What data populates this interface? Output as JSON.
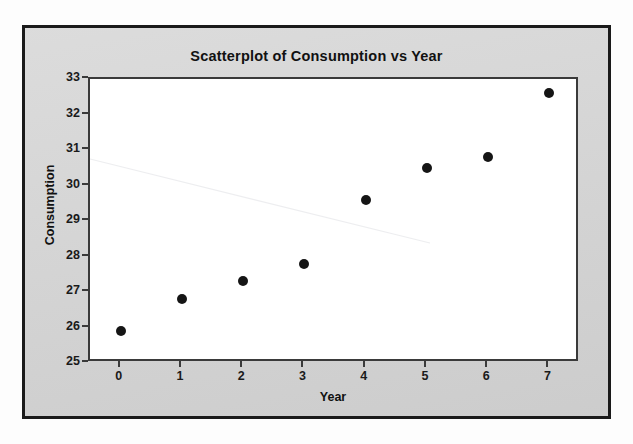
{
  "chart_data": {
    "type": "scatter",
    "title": "Scatterplot of Consumption vs Year",
    "xlabel": "Year",
    "ylabel": "Consumption",
    "x": [
      0,
      1,
      2,
      3,
      4,
      5,
      6,
      7
    ],
    "values": [
      25.9,
      26.8,
      27.3,
      27.8,
      29.6,
      30.5,
      30.8,
      32.6
    ],
    "series": [
      {
        "name": "Consumption",
        "values": [
          25.9,
          26.8,
          27.3,
          27.8,
          29.6,
          30.5,
          30.8,
          32.6
        ]
      }
    ],
    "xlim": [
      -0.5,
      7.5
    ],
    "ylim": [
      25,
      33
    ],
    "xticks": [
      "0",
      "1",
      "2",
      "3",
      "4",
      "5",
      "6",
      "7"
    ],
    "yticks": [
      "25",
      "26",
      "27",
      "28",
      "29",
      "30",
      "31",
      "32",
      "33"
    ],
    "grid": false,
    "legend": "none",
    "marker_color": "#151515",
    "plot_background": "#ffffff",
    "panel_background": "#d4d4d4",
    "border_color": "#1a1a1a"
  }
}
